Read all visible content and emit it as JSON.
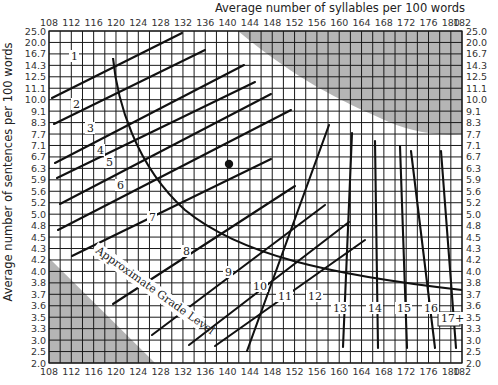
{
  "chart_data": {
    "type": "line",
    "xlabel": "Average number of syllables per 100 words",
    "ylabel": "Average number of sentences per 100 words",
    "x_ticks": [
      108,
      112,
      116,
      120,
      124,
      128,
      132,
      136,
      140,
      144,
      148,
      152,
      156,
      160,
      164,
      168,
      172,
      176,
      180,
      182
    ],
    "y_ticks": [
      "25.0",
      "20.0",
      "16.7",
      "14.3",
      "12.5",
      "11.1",
      "10.0",
      "9.1",
      "8.3",
      "7.7",
      "7.1",
      "6.7",
      "6.3",
      "5.9",
      "5.6",
      "5.2",
      "5.0",
      "4.8",
      "4.5",
      "4.3",
      "4.2",
      "4.0",
      "3.8",
      "3.7",
      "3.6",
      "3.5",
      "3.3",
      "3.0",
      "2.5",
      "2.0"
    ],
    "xlim": [
      108,
      182
    ],
    "grid": true,
    "curve_label": "Approximate Grade Level",
    "grade_lines": [
      {
        "grade": "1",
        "label_pos": [
          71,
          60
        ],
        "from": [
          52,
          98
        ],
        "to": [
          182,
          33
        ]
      },
      {
        "grade": "2",
        "label_pos": [
          73,
          108
        ],
        "from": [
          54,
          124
        ],
        "to": [
          205,
          50
        ]
      },
      {
        "grade": "3",
        "label_pos": [
          87,
          132
        ],
        "from": [
          55,
          163
        ],
        "to": [
          244,
          65
        ]
      },
      {
        "grade": "4",
        "label_pos": [
          97,
          154
        ],
        "from": [
          57,
          178
        ],
        "to": [
          255,
          82
        ]
      },
      {
        "grade": "5",
        "label_pos": [
          106,
          166
        ],
        "from": [
          60,
          204
        ],
        "to": [
          271,
          94
        ]
      },
      {
        "grade": "6",
        "label_pos": [
          117,
          189
        ],
        "from": [
          58,
          230
        ],
        "to": [
          291,
          110
        ]
      },
      {
        "grade": "7",
        "label_pos": [
          149,
          221
        ],
        "from": [
          72,
          256
        ],
        "to": [
          271,
          159
        ]
      },
      {
        "grade": "8",
        "label_pos": [
          183,
          255
        ],
        "from": [
          113,
          304
        ],
        "to": [
          295,
          186
        ]
      },
      {
        "grade": "9",
        "label_pos": [
          225,
          276
        ],
        "from": [
          152,
          335
        ],
        "to": [
          325,
          205
        ]
      },
      {
        "grade": "10",
        "label_pos": [
          253,
          290
        ],
        "from": [
          189,
          345
        ],
        "to": [
          349,
          222
        ]
      },
      {
        "grade": "11",
        "label_pos": [
          278,
          300
        ],
        "from": [
          215,
          346
        ],
        "to": [
          365,
          240
        ]
      },
      {
        "grade": "12",
        "label_pos": [
          308,
          300
        ],
        "from": [
          247,
          351
        ],
        "to": [
          329,
          125
        ]
      },
      {
        "grade": "13",
        "label_pos": [
          333,
          312
        ],
        "from": [
          343,
          347
        ],
        "to": [
          352,
          133
        ]
      },
      {
        "grade": "14",
        "label_pos": [
          368,
          312
        ],
        "from": [
          378,
          348
        ],
        "to": [
          375,
          141
        ]
      },
      {
        "grade": "15",
        "label_pos": [
          397,
          312
        ],
        "from": [
          407,
          348
        ],
        "to": [
          400,
          146
        ]
      },
      {
        "grade": "16",
        "label_pos": [
          424,
          312
        ],
        "from": [
          435,
          348
        ],
        "to": [
          411,
          151
        ]
      },
      {
        "grade": "17+",
        "label_pos": [
          441,
          322
        ],
        "from": [
          456,
          348
        ],
        "to": [
          441,
          151
        ]
      }
    ],
    "point": {
      "x": 141,
      "y": 6.5,
      "px": [
        229,
        164
      ]
    },
    "shaded_regions": [
      "upper-right invalid region",
      "lower-left invalid region"
    ],
    "colors": {
      "grid": "#1a1a1a",
      "lines": "#111111",
      "shade": "#b5b5b5",
      "background": "#ffffff"
    }
  }
}
